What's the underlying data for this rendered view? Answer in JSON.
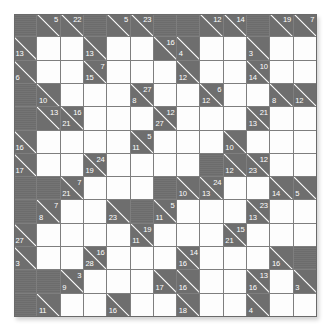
{
  "puzzle": {
    "kind": "kakuro",
    "title": "Kakuro Puzzle Grid",
    "rows": 13,
    "cols": 13,
    "colors": {
      "block": "#6e6e6e",
      "open": "#fdfdfd",
      "grid_line": "#7e7e7e",
      "clue_text": "#ffffff",
      "page_background": "#ffffff"
    },
    "legend": {
      "open_cell": "empty-answer-cell",
      "block_cell": "solid-block-cell",
      "clue_cell": "split-clue-cell",
      "across_clue_position": "upper-right",
      "down_clue_position": "lower-left"
    },
    "cells": [
      [
        {
          "t": "block"
        },
        {
          "t": "clue",
          "right": "5"
        },
        {
          "t": "clue",
          "right": "22"
        },
        {
          "t": "block"
        },
        {
          "t": "clue",
          "right": "5"
        },
        {
          "t": "clue",
          "right": "23"
        },
        {
          "t": "block"
        },
        {
          "t": "block"
        },
        {
          "t": "clue",
          "right": "12"
        },
        {
          "t": "clue",
          "right": "14"
        },
        {
          "t": "block"
        },
        {
          "t": "clue",
          "right": "19"
        },
        {
          "t": "clue",
          "right": "7"
        }
      ],
      [
        {
          "t": "clue",
          "down": "13"
        },
        {
          "t": "open"
        },
        {
          "t": "open"
        },
        {
          "t": "clue",
          "down": "13"
        },
        {
          "t": "open"
        },
        {
          "t": "open"
        },
        {
          "t": "clue",
          "right": "16"
        },
        {
          "t": "clue",
          "down": "4"
        },
        {
          "t": "open"
        },
        {
          "t": "open"
        },
        {
          "t": "clue",
          "down": "3"
        },
        {
          "t": "open"
        },
        {
          "t": "open"
        }
      ],
      [
        {
          "t": "clue",
          "down": "6"
        },
        {
          "t": "open"
        },
        {
          "t": "open"
        },
        {
          "t": "clue",
          "down": "15",
          "right": "7"
        },
        {
          "t": "open"
        },
        {
          "t": "open"
        },
        {
          "t": "open"
        },
        {
          "t": "clue",
          "down": "12"
        },
        {
          "t": "open"
        },
        {
          "t": "open"
        },
        {
          "t": "clue",
          "down": "14",
          "right": "10"
        },
        {
          "t": "open"
        },
        {
          "t": "open"
        }
      ],
      [
        {
          "t": "block"
        },
        {
          "t": "clue",
          "down": "10"
        },
        {
          "t": "open"
        },
        {
          "t": "open"
        },
        {
          "t": "open"
        },
        {
          "t": "clue",
          "down": "8",
          "right": "27"
        },
        {
          "t": "open"
        },
        {
          "t": "open"
        },
        {
          "t": "clue",
          "down": "12",
          "right": "6"
        },
        {
          "t": "open"
        },
        {
          "t": "open"
        },
        {
          "t": "clue",
          "down": "8"
        },
        {
          "t": "clue",
          "down": "12"
        }
      ],
      [
        {
          "t": "block"
        },
        {
          "t": "clue",
          "right": "13"
        },
        {
          "t": "clue",
          "down": "21",
          "right": "16"
        },
        {
          "t": "open"
        },
        {
          "t": "open"
        },
        {
          "t": "open"
        },
        {
          "t": "clue",
          "down": "27",
          "right": "12"
        },
        {
          "t": "open"
        },
        {
          "t": "open"
        },
        {
          "t": "open"
        },
        {
          "t": "clue",
          "down": "13",
          "right": "21"
        },
        {
          "t": "open"
        },
        {
          "t": "open"
        }
      ],
      [
        {
          "t": "clue",
          "down": "16"
        },
        {
          "t": "open"
        },
        {
          "t": "open"
        },
        {
          "t": "open"
        },
        {
          "t": "open"
        },
        {
          "t": "clue",
          "down": "11",
          "right": "5"
        },
        {
          "t": "open"
        },
        {
          "t": "open"
        },
        {
          "t": "open"
        },
        {
          "t": "clue",
          "down": "10"
        },
        {
          "t": "open"
        },
        {
          "t": "open"
        },
        {
          "t": "open"
        }
      ],
      [
        {
          "t": "clue",
          "down": "17"
        },
        {
          "t": "open"
        },
        {
          "t": "open"
        },
        {
          "t": "clue",
          "down": "19",
          "right": "24"
        },
        {
          "t": "open"
        },
        {
          "t": "open"
        },
        {
          "t": "open"
        },
        {
          "t": "open"
        },
        {
          "t": "block"
        },
        {
          "t": "clue",
          "down": "12"
        },
        {
          "t": "clue",
          "down": "23",
          "right": "12"
        },
        {
          "t": "open"
        },
        {
          "t": "open"
        }
      ],
      [
        {
          "t": "block"
        },
        {
          "t": "block"
        },
        {
          "t": "clue",
          "down": "21",
          "right": "7"
        },
        {
          "t": "open"
        },
        {
          "t": "open"
        },
        {
          "t": "open"
        },
        {
          "t": "block"
        },
        {
          "t": "clue",
          "down": "10"
        },
        {
          "t": "clue",
          "down": "13",
          "right": "24"
        },
        {
          "t": "open"
        },
        {
          "t": "open"
        },
        {
          "t": "clue",
          "down": "14"
        },
        {
          "t": "clue",
          "down": "5"
        }
      ],
      [
        {
          "t": "block"
        },
        {
          "t": "clue",
          "down": "8",
          "right": "7"
        },
        {
          "t": "open"
        },
        {
          "t": "open"
        },
        {
          "t": "clue",
          "down": "23"
        },
        {
          "t": "block"
        },
        {
          "t": "clue",
          "down": "11",
          "right": "5"
        },
        {
          "t": "open"
        },
        {
          "t": "open"
        },
        {
          "t": "open"
        },
        {
          "t": "clue",
          "down": "13",
          "right": "23"
        },
        {
          "t": "open"
        },
        {
          "t": "open"
        }
      ],
      [
        {
          "t": "clue",
          "down": "27"
        },
        {
          "t": "open"
        },
        {
          "t": "open"
        },
        {
          "t": "open"
        },
        {
          "t": "open"
        },
        {
          "t": "clue",
          "down": "11",
          "right": "19"
        },
        {
          "t": "open"
        },
        {
          "t": "open"
        },
        {
          "t": "open"
        },
        {
          "t": "clue",
          "down": "21",
          "right": "15"
        },
        {
          "t": "open"
        },
        {
          "t": "open"
        },
        {
          "t": "open"
        }
      ],
      [
        {
          "t": "clue",
          "down": "3"
        },
        {
          "t": "open"
        },
        {
          "t": "open"
        },
        {
          "t": "clue",
          "down": "28",
          "right": "16"
        },
        {
          "t": "open"
        },
        {
          "t": "open"
        },
        {
          "t": "open"
        },
        {
          "t": "clue",
          "down": "16",
          "right": "14"
        },
        {
          "t": "open"
        },
        {
          "t": "open"
        },
        {
          "t": "open"
        },
        {
          "t": "clue",
          "down": "16"
        },
        {
          "t": "block"
        }
      ],
      [
        {
          "t": "block"
        },
        {
          "t": "block"
        },
        {
          "t": "clue",
          "down": "9",
          "right": "3"
        },
        {
          "t": "open"
        },
        {
          "t": "open"
        },
        {
          "t": "open"
        },
        {
          "t": "clue",
          "down": "17"
        },
        {
          "t": "clue",
          "down": "16"
        },
        {
          "t": "open"
        },
        {
          "t": "open"
        },
        {
          "t": "clue",
          "down": "16",
          "right": "13"
        },
        {
          "t": "open"
        },
        {
          "t": "clue",
          "down": "3"
        }
      ],
      [
        {
          "t": "block"
        },
        {
          "t": "clue",
          "down": "11"
        },
        {
          "t": "open"
        },
        {
          "t": "open"
        },
        {
          "t": "clue",
          "down": "16"
        },
        {
          "t": "open"
        },
        {
          "t": "open"
        },
        {
          "t": "clue",
          "down": "18"
        },
        {
          "t": "open"
        },
        {
          "t": "open"
        },
        {
          "t": "clue",
          "down": "4"
        },
        {
          "t": "open"
        },
        {
          "t": "open"
        }
      ]
    ],
    "bottom_row_clues": [
      {
        "col": 1,
        "down": "7"
      },
      {
        "col": 4,
        "down": "9"
      },
      {
        "col": 7,
        "down": "5"
      },
      {
        "col": 10,
        "down": "8"
      }
    ]
  }
}
